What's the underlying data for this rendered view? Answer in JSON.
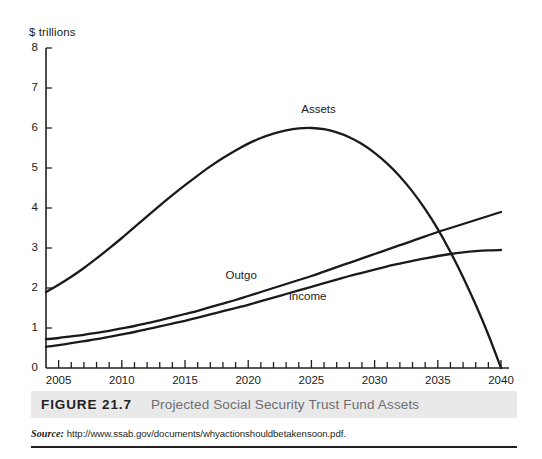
{
  "figure": {
    "number_label": "FIGURE 21.7",
    "title": "Projected Social Security Trust Fund Assets",
    "source_word": "Source:",
    "source_url": "http://www.ssab.gov/documents/whyactionshouldbetakensoon.pdf."
  },
  "chart_data": {
    "type": "line",
    "title": "Projected Social Security Trust Fund Assets",
    "xlabel": "",
    "ylabel": "$ trillions",
    "y_unit_label": "$ trillions",
    "xlim": [
      2004,
      2040
    ],
    "ylim": [
      0,
      8
    ],
    "y_ticks": [
      0,
      1,
      2,
      3,
      4,
      5,
      6,
      7,
      8
    ],
    "y_tick_labels": [
      "0",
      "1",
      "2",
      "3",
      "4",
      "5",
      "6",
      "7",
      "8"
    ],
    "x_ticks": [
      2005,
      2010,
      2015,
      2020,
      2025,
      2030,
      2035,
      2040
    ],
    "x_tick_labels": [
      "2005",
      "2010",
      "2015",
      "2020",
      "2025",
      "2030",
      "2035",
      "2040"
    ],
    "x_minor_tick_interval": 1,
    "grid": false,
    "legend": "inline-labels",
    "annotations": [
      {
        "text": "Assets",
        "x": 2024.2,
        "y": 6.45
      },
      {
        "text": "Outgo",
        "x": 2018.2,
        "y": 2.3
      },
      {
        "text": "Income",
        "x": 2023.2,
        "y": 1.78
      }
    ],
    "x": [
      2004,
      2005,
      2006,
      2007,
      2008,
      2009,
      2010,
      2011,
      2012,
      2013,
      2014,
      2015,
      2016,
      2017,
      2018,
      2019,
      2020,
      2021,
      2022,
      2023,
      2024,
      2025,
      2026,
      2027,
      2028,
      2029,
      2030,
      2031,
      2032,
      2033,
      2034,
      2035,
      2036,
      2037,
      2038,
      2039,
      2040
    ],
    "series": [
      {
        "name": "Assets",
        "color": "#1a1a1a",
        "values": [
          1.9,
          2.08,
          2.28,
          2.5,
          2.74,
          2.99,
          3.25,
          3.52,
          3.79,
          4.06,
          4.32,
          4.57,
          4.81,
          5.04,
          5.25,
          5.44,
          5.61,
          5.75,
          5.86,
          5.94,
          5.99,
          6.0,
          5.97,
          5.89,
          5.77,
          5.6,
          5.38,
          5.11,
          4.79,
          4.41,
          3.97,
          3.47,
          2.9,
          2.27,
          1.58,
          0.83,
          0.0
        ]
      },
      {
        "name": "Outgo",
        "color": "#1a1a1a",
        "values": [
          0.72,
          0.75,
          0.79,
          0.83,
          0.88,
          0.93,
          0.99,
          1.05,
          1.12,
          1.19,
          1.27,
          1.35,
          1.43,
          1.52,
          1.61,
          1.7,
          1.8,
          1.9,
          2.0,
          2.1,
          2.2,
          2.3,
          2.41,
          2.52,
          2.63,
          2.74,
          2.85,
          2.96,
          3.07,
          3.18,
          3.29,
          3.4,
          3.5,
          3.6,
          3.7,
          3.8,
          3.9
        ]
      },
      {
        "name": "Income",
        "color": "#1a1a1a",
        "values": [
          0.53,
          0.57,
          0.62,
          0.67,
          0.72,
          0.78,
          0.84,
          0.9,
          0.97,
          1.04,
          1.11,
          1.18,
          1.26,
          1.34,
          1.42,
          1.5,
          1.58,
          1.67,
          1.76,
          1.85,
          1.94,
          2.03,
          2.12,
          2.21,
          2.3,
          2.38,
          2.46,
          2.54,
          2.61,
          2.68,
          2.74,
          2.8,
          2.85,
          2.89,
          2.92,
          2.94,
          2.95
        ]
      }
    ]
  }
}
